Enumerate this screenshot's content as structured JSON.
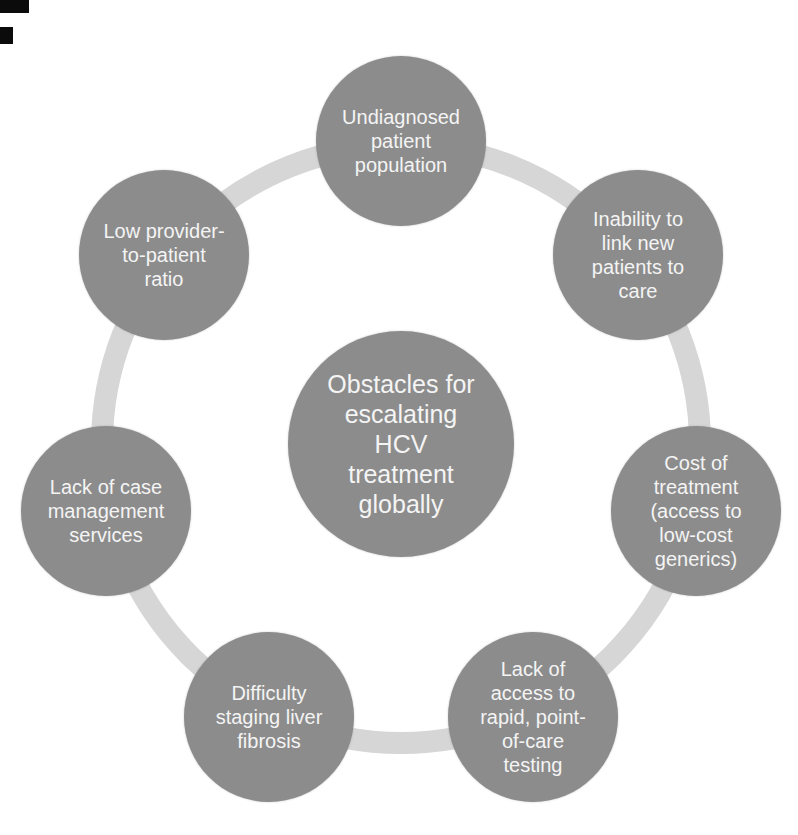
{
  "figure": {
    "colors": {
      "background": "#ffffff",
      "node_fill": "#8c8c8c",
      "ring": "#d6d6d6",
      "node_text": "#f4f4f4"
    },
    "center": {
      "label": "Obstacles for\nescalating\nHCV\ntreatment\nglobally"
    },
    "satellites": [
      {
        "position": "top",
        "label": "Undiagnosed\npatient\npopulation"
      },
      {
        "position": "top-right",
        "label": "Inability to\nlink new\npatients to\ncare"
      },
      {
        "position": "right",
        "label": "Cost of\ntreatment\n(access to\nlow-cost\ngenerics)"
      },
      {
        "position": "bottom-right",
        "label": "Lack of\naccess to\nrapid, point-\nof-care\ntesting"
      },
      {
        "position": "bottom-left",
        "label": "Difficulty\nstaging liver\nfibrosis"
      },
      {
        "position": "left",
        "label": "Lack of case\nmanagement\nservices"
      },
      {
        "position": "top-left",
        "label": "Low provider-\nto-patient\nratio"
      }
    ]
  }
}
